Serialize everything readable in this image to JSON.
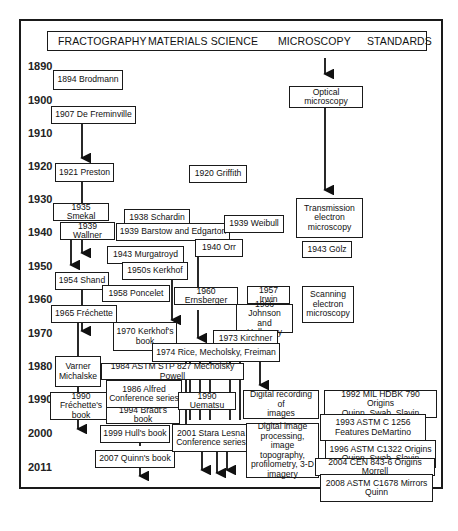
{
  "header": {
    "columns": [
      "FRACTOGRAPHY",
      "MATERIALS SCIENCE",
      "MICROSCOPY",
      "STANDARDS"
    ]
  },
  "years": [
    "1890",
    "1900",
    "1910",
    "1920",
    "1930",
    "1940",
    "1950",
    "1960",
    "1970",
    "1980",
    "1990",
    "2000",
    "2011"
  ],
  "fractography": {
    "brodmann": "1894 Brodmann",
    "freminville": "1907 De Freminville",
    "preston": "1921 Preston",
    "smekal": "1935 Smekal",
    "wallner": "1939 Wallner",
    "shand": "1954 Shand",
    "frechette": "1965 Fréchette",
    "varner": "Varner\nMichalske",
    "frechette_book": "1990 Fréchette's\nbook",
    "bradt": "1994 Bradt's book",
    "hull": "1999 Hull's book",
    "quinn": "2007 Quinn's book"
  },
  "materials": {
    "griffith": "1920 Griffith",
    "schardin": "1938 Schardin",
    "barstow": "1939 Barstow and Edgarton",
    "weibull": "1939 Weibull",
    "orr": "1940 Orr",
    "murgatroyd": "1943 Murgatroyd",
    "kerkhof": "1950s Kerkhof",
    "poncelet": "1958 Poncelet",
    "ernsberger": "1960 Ernsberger",
    "irwin": "1957 Irwin",
    "johnson": "1966 Johnson\nand Holloway",
    "kerkhof_book": "1970 Kerkhof's\nbook",
    "kirchner": "1973 Kirchner",
    "rice": "1974  Rice, Mecholsky, Freiman",
    "astm_stp": "1984 ASTM STP 827 Mecholsky Powell",
    "alfred": "1986  Alfred\nConference series",
    "uematsu": "1990 Uematsu",
    "stara_lesna": "2001 Stara Lesna\nConference series"
  },
  "microscopy": {
    "optical": "Optical microscopy",
    "tem": "Transmission\nelectron\nmicroscopy",
    "golz": "1943 Gölz",
    "sem": "Scanning\nelectron\nmicroscopy",
    "digital_recording": "Digital recording of\nimages",
    "digital_processing": "Digital image\nprocessing, image\ntopography,\nprofilometry, 3-D\nimagery"
  },
  "standards": {
    "mil_hdbk": "1992   MIL HDBK 790 Origins\nQuinn, Swab, Slavin",
    "astm_c1256": "1993   ASTM C 1256\nFeatures DeMartino",
    "astm_c1322": "1996   ASTM C1322 Origins\nQuinn. Swab. Slavin",
    "cen": "2004 CEN 843-6 Origins Morrell",
    "astm_c1678": "2008  ASTM C1678 Mirrors\nQuinn"
  }
}
